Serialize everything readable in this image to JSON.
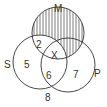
{
  "diagram": {
    "type": "venn",
    "sets": [
      {
        "name": "M",
        "label": "M"
      },
      {
        "name": "S",
        "label": "S"
      },
      {
        "name": "P",
        "label": "P"
      }
    ],
    "regions": {
      "s_only": "5",
      "s_and_m_only": "2",
      "s_and_m_and_p": "X",
      "s_and_p_only": "6",
      "p_only": "7",
      "outside": "8"
    },
    "shaded_region": "M minus S (hatched)",
    "colors": {
      "stroke": "#333333",
      "hatch": "#444444",
      "background": "#ffffff"
    }
  }
}
